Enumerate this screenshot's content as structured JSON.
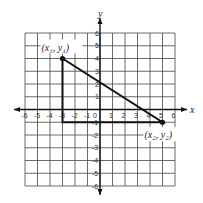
{
  "diagram": {
    "type": "coordinate-plane",
    "axis_labels": {
      "x": "x",
      "y": "y"
    },
    "x_ticks": [
      "-6",
      "-5",
      "-4",
      "-3",
      "-2",
      "-1",
      "0",
      "1",
      "2",
      "3",
      "4",
      "5",
      "6"
    ],
    "y_ticks": [
      "6",
      "5",
      "4",
      "3",
      "2",
      "1",
      "-1",
      "-2",
      "-3",
      "-4",
      "-5",
      "-6"
    ],
    "x_range": [
      -6,
      6
    ],
    "y_range": [
      -6,
      6
    ],
    "points": [
      {
        "label": "(x₁, y₁)",
        "x": -3,
        "y": 4
      },
      {
        "label": "(x₂, y₂)",
        "x": 5,
        "y": -1
      }
    ],
    "triangle_vertices": [
      [
        -3,
        4
      ],
      [
        -3,
        -1
      ],
      [
        5,
        -1
      ]
    ]
  }
}
